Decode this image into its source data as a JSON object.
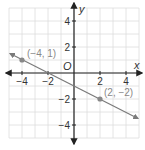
{
  "chart_data": {
    "type": "line",
    "title": "",
    "xlabel": "x",
    "ylabel": "y",
    "origin_label": "O",
    "xlim": [
      -5,
      5
    ],
    "ylim": [
      -5,
      5
    ],
    "grid": true,
    "x_ticks": [
      -4,
      -2,
      2,
      4
    ],
    "y_ticks": [
      4,
      2,
      -2,
      -4
    ],
    "x_tick_labels": [
      "−4",
      "−2",
      "2",
      "4"
    ],
    "y_tick_labels": [
      "4",
      "2",
      "−2",
      "−4"
    ],
    "series": [
      {
        "name": "line",
        "slope": -0.5,
        "intercept": -1,
        "x": [
          -5,
          5
        ],
        "y": [
          1.5,
          -3.5
        ],
        "arrows": "both"
      }
    ],
    "points": [
      {
        "x": -4,
        "y": 1,
        "label": "(−4, 1)"
      },
      {
        "x": 2,
        "y": -2,
        "label": "(2, −2)"
      }
    ],
    "colors": {
      "axis": "#222222",
      "grid": "#dddddd",
      "line": "#7a7a7a",
      "point": "#888888",
      "label": "#888888",
      "text": "#333333"
    }
  }
}
